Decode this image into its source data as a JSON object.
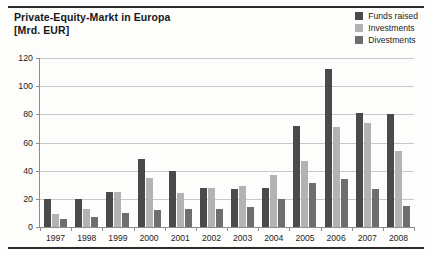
{
  "figure": {
    "title_line1": "Private-Equity-Markt in Europa",
    "title_line2": "[Mrd. EUR]"
  },
  "colors": {
    "funds_raised": "#4a4a4a",
    "investments": "#b3b3b3",
    "divestments": "#6e6e6e",
    "gridline": "#c9c9c9",
    "axis": "#8d8d8d",
    "rule": "#2b2b2b",
    "background": "#fdfdfb"
  },
  "legend": {
    "position": "top-right",
    "items": [
      {
        "label": "Funds raised",
        "color": "#4a4a4a",
        "swatch": "legend-swatch-funds-raised"
      },
      {
        "label": "Investments",
        "color": "#b3b3b3",
        "swatch": "legend-swatch-investments"
      },
      {
        "label": "Divestments",
        "color": "#6e6e6e",
        "swatch": "legend-swatch-divestments"
      }
    ]
  },
  "chart_data": {
    "type": "bar",
    "title": "Private-Equity-Markt in Europa",
    "subtitle": "[Mrd. EUR]",
    "xlabel": "",
    "ylabel": "Mrd. EUR",
    "ylim": [
      0,
      120
    ],
    "yticks": [
      0,
      20,
      40,
      60,
      80,
      100,
      120
    ],
    "ytick_labels": [
      "0",
      "20",
      "40",
      "60",
      "80",
      "100",
      "120"
    ],
    "grid": true,
    "legend_position": "top-right",
    "categories": [
      "1997",
      "1998",
      "1999",
      "2000",
      "2001",
      "2002",
      "2003",
      "2004",
      "2005",
      "2006",
      "2007",
      "2008"
    ],
    "series": [
      {
        "name": "Funds raised",
        "color": "#4a4a4a",
        "values": [
          20,
          20,
          25,
          48,
          40,
          28,
          27,
          28,
          72,
          112,
          81,
          80
        ]
      },
      {
        "name": "Investments",
        "color": "#b3b3b3",
        "values": [
          9,
          13,
          25,
          35,
          24,
          28,
          29,
          37,
          47,
          71,
          74,
          54
        ]
      },
      {
        "name": "Divestments",
        "color": "#6e6e6e",
        "values": [
          6,
          7,
          10,
          12,
          13,
          13,
          14,
          20,
          31,
          34,
          27,
          15
        ]
      }
    ]
  }
}
